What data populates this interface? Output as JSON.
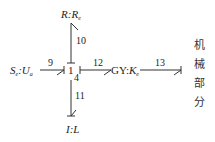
{
  "diagram": {
    "type": "bond-graph",
    "nodes": {
      "resistor": {
        "name": "R",
        "param": "R",
        "param_sub": "e"
      },
      "source": {
        "name": "S",
        "name_sub": "e",
        "param": "U",
        "param_sub": "a"
      },
      "junction": {
        "label": "1"
      },
      "junction_bond": {
        "label": "4"
      },
      "gyrator": {
        "name": "GY",
        "param": "K",
        "param_sub": "e"
      },
      "inertia": {
        "name": "I",
        "param": "L"
      },
      "mechanical": {
        "chars": [
          "机",
          "械",
          "部",
          "分"
        ]
      }
    },
    "bonds": [
      {
        "id": "9",
        "from": "source",
        "to": "junction"
      },
      {
        "id": "10",
        "from": "junction",
        "to": "resistor"
      },
      {
        "id": "11",
        "from": "junction",
        "to": "inertia"
      },
      {
        "id": "12",
        "from": "junction",
        "to": "gyrator"
      },
      {
        "id": "13",
        "from": "gyrator",
        "to": "mechanical"
      }
    ]
  }
}
